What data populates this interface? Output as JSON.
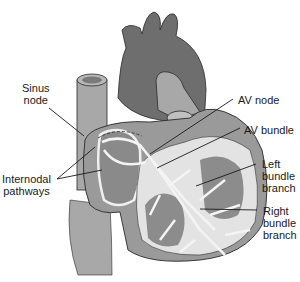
{
  "diagram": {
    "type": "anatomical-illustration",
    "colors": {
      "background": "#ffffff",
      "dark_tissue": "#6e6e6e",
      "medium_tissue": "#9a9a9a",
      "light_tissue": "#c8c8c8",
      "conduction_path": "#e8e8e8",
      "outline": "#2a2a2a",
      "label_text": "#1a1a1a"
    },
    "labels": [
      {
        "id": "sinus-node",
        "text": "Sinus\nnode"
      },
      {
        "id": "internodal-pathways",
        "text": "Internodal\npathways"
      },
      {
        "id": "av-node",
        "text": "AV node"
      },
      {
        "id": "av-bundle",
        "text": "AV bundle"
      },
      {
        "id": "left-bundle-branch",
        "text": "Left\nbundle\nbranch"
      },
      {
        "id": "right-bundle-branch",
        "text": "Right\nbundle\nbranch"
      }
    ]
  }
}
